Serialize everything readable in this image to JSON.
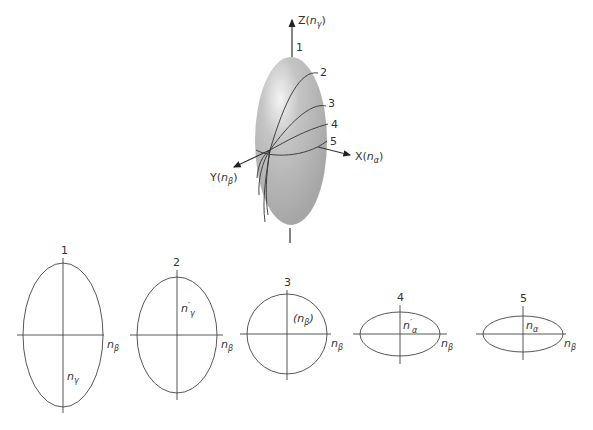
{
  "ellipsoid": {
    "axes": {
      "z": {
        "name": "Z",
        "index": "n",
        "sub": "γ"
      },
      "x": {
        "name": "X",
        "index": "n",
        "sub": "α"
      },
      "y": {
        "name": "Y",
        "index": "n",
        "sub": "β"
      }
    },
    "section_labels": [
      "1",
      "2",
      "3",
      "4",
      "5"
    ],
    "fill_color": "#a9a9a9",
    "highlight_color": "#f2f2f2"
  },
  "sections": [
    {
      "number": "1",
      "inner_label": "n",
      "inner_sub": "γ",
      "inner_prime": "",
      "side_label": "n",
      "side_sub": "β"
    },
    {
      "number": "2",
      "inner_label": "n",
      "inner_sub": "γ",
      "inner_prime": "′",
      "side_label": "n",
      "side_sub": "β"
    },
    {
      "number": "3",
      "inner_label": "(n",
      "inner_sub": "β",
      "inner_close": ")",
      "side_label": "n",
      "side_sub": "β"
    },
    {
      "number": "4",
      "inner_label": "n",
      "inner_sub": "α",
      "inner_prime": "′",
      "side_label": "n",
      "side_sub": "β"
    },
    {
      "number": "5",
      "inner_label": "n",
      "inner_sub": "α",
      "inner_prime": "",
      "side_label": "n",
      "side_sub": "β"
    }
  ]
}
